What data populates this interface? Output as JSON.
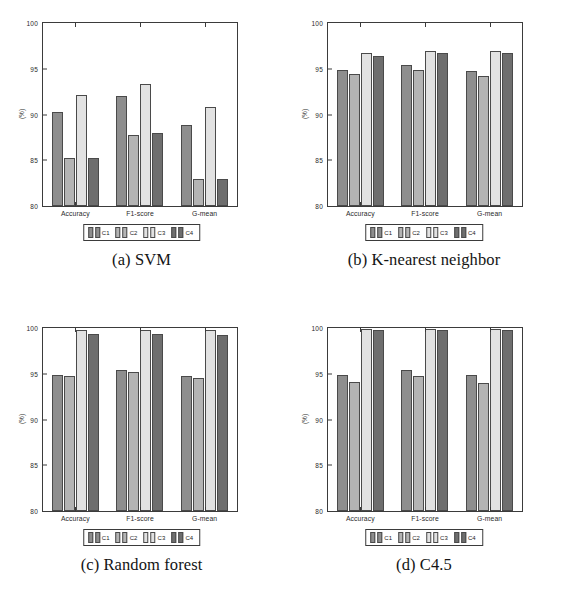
{
  "figure": {
    "panel_letters": [
      "(a)",
      "(b)",
      "(c)",
      "(d)"
    ],
    "ylabel": "(%)",
    "legend_labels": [
      "C1",
      "C2",
      "C3",
      "C4"
    ],
    "series_colors": [
      "#8e8e8e",
      "#b4b4b4",
      "#e2e2e2",
      "#6e6e6e"
    ],
    "axis_color": "#3b3b3b"
  },
  "chart_data": [
    {
      "type": "bar",
      "title": "(a) SVM",
      "caption": "(a) SVM",
      "categories": [
        "Accuracy",
        "F1-score",
        "G-mean"
      ],
      "series": [
        {
          "name": "C1",
          "values": [
            90.3,
            92.0,
            88.9
          ]
        },
        {
          "name": "C2",
          "values": [
            85.2,
            87.8,
            82.9
          ]
        },
        {
          "name": "C3",
          "values": [
            92.1,
            93.3,
            90.8
          ]
        },
        {
          "name": "C4",
          "values": [
            85.3,
            88.0,
            82.9
          ]
        }
      ],
      "xlabel": "",
      "ylabel": "(%)",
      "ylim": [
        80,
        100
      ],
      "yticks": [
        80,
        85,
        90,
        95,
        100
      ],
      "grid": false,
      "legend_position": "below-axes"
    },
    {
      "type": "bar",
      "title": "(b) K-nearest neighbor",
      "caption": "(b) K-nearest neighbor",
      "categories": [
        "Accuracy",
        "F1-score",
        "G-mean"
      ],
      "series": [
        {
          "name": "C1",
          "values": [
            94.9,
            95.4,
            94.8
          ]
        },
        {
          "name": "C2",
          "values": [
            94.4,
            94.9,
            94.2
          ]
        },
        {
          "name": "C3",
          "values": [
            96.7,
            96.9,
            96.9
          ]
        },
        {
          "name": "C4",
          "values": [
            96.4,
            96.7,
            96.7
          ]
        }
      ],
      "xlabel": "",
      "ylabel": "(%)",
      "ylim": [
        80,
        100
      ],
      "yticks": [
        80,
        85,
        90,
        95,
        100
      ],
      "grid": false,
      "legend_position": "below-axes"
    },
    {
      "type": "bar",
      "title": "(c) Random forest",
      "caption": "(c) Random forest",
      "categories": [
        "Accuracy",
        "F1-score",
        "G-mean"
      ],
      "series": [
        {
          "name": "C1",
          "values": [
            94.9,
            95.4,
            94.8
          ]
        },
        {
          "name": "C2",
          "values": [
            94.8,
            95.2,
            94.5
          ]
        },
        {
          "name": "C3",
          "values": [
            99.8,
            99.8,
            99.8
          ]
        },
        {
          "name": "C4",
          "values": [
            99.3,
            99.4,
            99.2
          ]
        }
      ],
      "xlabel": "",
      "ylabel": "(%)",
      "ylim": [
        80,
        100
      ],
      "yticks": [
        80,
        85,
        90,
        95,
        100
      ],
      "grid": false,
      "legend_position": "below-axes"
    },
    {
      "type": "bar",
      "title": "(d) C4.5",
      "caption": "(d) C4.5",
      "categories": [
        "Accuracy",
        "F1-score",
        "G-mean"
      ],
      "series": [
        {
          "name": "C1",
          "values": [
            94.9,
            95.4,
            94.9
          ]
        },
        {
          "name": "C2",
          "values": [
            94.1,
            94.8,
            94.0
          ]
        },
        {
          "name": "C3",
          "values": [
            99.9,
            99.9,
            99.9
          ]
        },
        {
          "name": "C4",
          "values": [
            99.8,
            99.8,
            99.8
          ]
        }
      ],
      "xlabel": "",
      "ylabel": "(%)",
      "ylim": [
        80,
        100
      ],
      "yticks": [
        80,
        85,
        90,
        95,
        100
      ],
      "grid": false,
      "legend_position": "below-axes"
    }
  ]
}
